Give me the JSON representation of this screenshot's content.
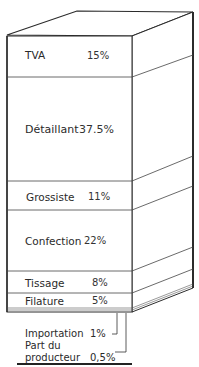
{
  "diagram": {
    "type": "stacked-3d-block",
    "segments": [
      {
        "label": "TVA",
        "value": "15%"
      },
      {
        "label": "Détaillant",
        "value": "37.5%"
      },
      {
        "label": "Grossiste",
        "value": "11%"
      },
      {
        "label": "Confection",
        "value": "22%"
      },
      {
        "label": "Tissage",
        "value": "8%"
      },
      {
        "label": "Filature",
        "value": "5%"
      }
    ],
    "below": [
      {
        "label": "Importation",
        "value": "1%"
      },
      {
        "label_line1": "Part du",
        "label_line2": "producteur",
        "value": "0,5%"
      }
    ],
    "colors": {
      "line": "#2b2b2b",
      "background": "#ffffff",
      "text": "#2a2a2a"
    }
  }
}
